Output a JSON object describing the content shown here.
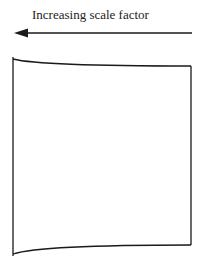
{
  "diagram": {
    "arrow_label": "Increasing scale factor",
    "arrow_direction": "left",
    "shape": "quadrilateral-with-curved-top-and-bottom-edges",
    "stroke_color": "#1a1a1a",
    "background_color": "#ffffff"
  }
}
